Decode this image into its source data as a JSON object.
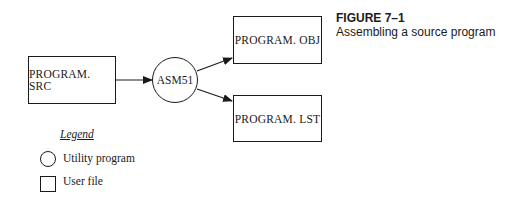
{
  "figure": {
    "title": "FIGURE 7–1",
    "caption": "Assembling a source program"
  },
  "nodes": {
    "source": {
      "label": "PROGRAM. SRC",
      "type": "user-file"
    },
    "assembler": {
      "label": "ASM51",
      "type": "utility-program"
    },
    "object": {
      "label": "PROGRAM. OBJ",
      "type": "user-file"
    },
    "listing": {
      "label": "PROGRAM. LST",
      "type": "user-file"
    }
  },
  "edges": [
    {
      "from": "PROGRAM. SRC",
      "to": "ASM51"
    },
    {
      "from": "ASM51",
      "to": "PROGRAM. OBJ"
    },
    {
      "from": "ASM51",
      "to": "PROGRAM. LST"
    }
  ],
  "legend": {
    "title": "Legend",
    "items": [
      {
        "symbol": "circle",
        "label": "Utility program"
      },
      {
        "symbol": "square",
        "label": "User file"
      }
    ]
  }
}
